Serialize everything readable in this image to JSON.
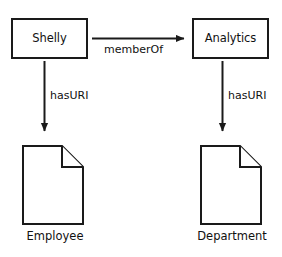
{
  "diagram": {
    "background_color": "#ffffff",
    "stroke_color": "#1a1a1a",
    "text_color": "#111111",
    "nodes": [
      {
        "id": "shelly",
        "label": "Shelly",
        "shape": "rectangle",
        "x": 11,
        "y": 18,
        "width": 77,
        "height": 41
      },
      {
        "id": "analytics",
        "label": "Analytics",
        "shape": "rectangle",
        "x": 192,
        "y": 18,
        "width": 77,
        "height": 41
      },
      {
        "id": "employee",
        "label": "Employee",
        "shape": "document",
        "x": 22,
        "y": 145,
        "width": 62,
        "height": 80
      },
      {
        "id": "department",
        "label": "Department",
        "shape": "document",
        "x": 200,
        "y": 145,
        "width": 62,
        "height": 80
      }
    ],
    "edges": [
      {
        "id": "member-of",
        "label": "memberOf",
        "from": "shelly",
        "to": "analytics",
        "direction": "right",
        "arrowhead": "filled-triangle"
      },
      {
        "id": "has-uri-left",
        "label": "hasURI",
        "from": "shelly",
        "to": "employee",
        "direction": "down",
        "arrowhead": "filled-triangle"
      },
      {
        "id": "has-uri-right",
        "label": "hasURI",
        "from": "analytics",
        "to": "department",
        "direction": "down",
        "arrowhead": "filled-triangle"
      }
    ]
  }
}
